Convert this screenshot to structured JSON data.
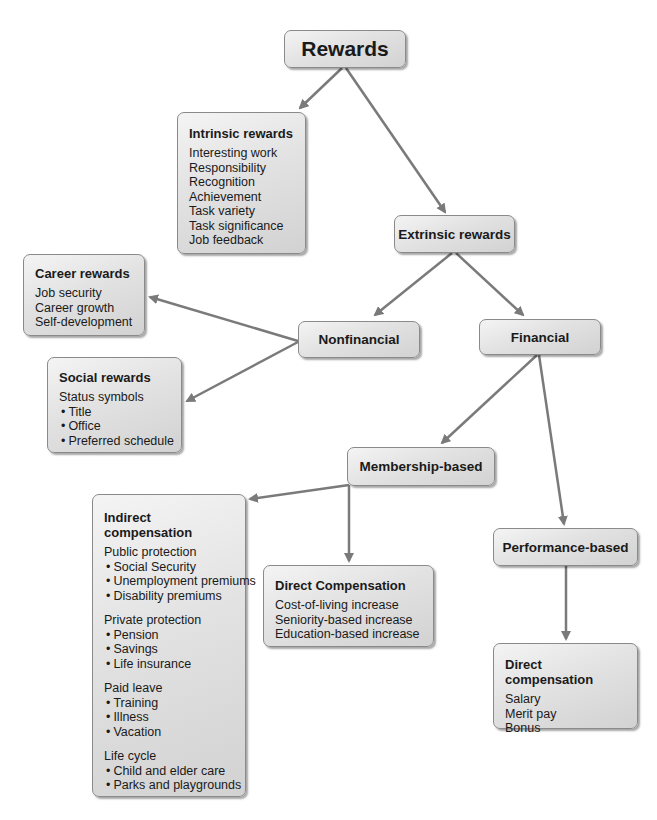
{
  "diagram": {
    "root": {
      "label": "Rewards"
    },
    "intrinsic": {
      "title": "Intrinsic rewards",
      "items": [
        "Interesting work",
        "Responsibility",
        "Recognition",
        "Achievement",
        "Task variety",
        "Task significance",
        "Job feedback"
      ]
    },
    "extrinsic": {
      "label": "Extrinsic rewards"
    },
    "nonfinancial": {
      "label": "Nonfinancial"
    },
    "financial": {
      "label": "Financial"
    },
    "career": {
      "title": "Career rewards",
      "items": [
        "Job security",
        "Career growth",
        "Self-development"
      ]
    },
    "social": {
      "title": "Social rewards",
      "heading": "Status symbols",
      "bullets": [
        "Title",
        "Office",
        "Preferred schedule"
      ]
    },
    "membership": {
      "label": "Membership-based"
    },
    "performance": {
      "label": "Performance-based"
    },
    "indirect": {
      "title": "Indirect compensation",
      "groups": [
        {
          "heading": "Public protection",
          "bullets": [
            "Social Security",
            "Unemployment premiums",
            "Disability premiums"
          ]
        },
        {
          "heading": "Private protection",
          "bullets": [
            "Pension",
            "Savings",
            "Life insurance"
          ]
        },
        {
          "heading": "Paid leave",
          "bullets": [
            "Training",
            "Illness",
            "Vacation"
          ]
        },
        {
          "heading": "Life cycle",
          "bullets": [
            "Child and elder care",
            "Parks and playgrounds"
          ]
        }
      ]
    },
    "direct_membership": {
      "title": "Direct Compensation",
      "items": [
        "Cost-of-living increase",
        "Seniority-based increase",
        "Education-based increase"
      ]
    },
    "direct_performance": {
      "title": "Direct compensation",
      "items": [
        "Salary",
        "Merit pay",
        "Bonus"
      ]
    },
    "arrow_color": "#7a7a7a"
  }
}
